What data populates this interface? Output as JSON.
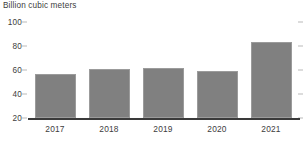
{
  "chart_data": {
    "type": "bar",
    "title": "Billion cubic meters",
    "xlabel": "",
    "ylabel": "",
    "categories": [
      "2017",
      "2018",
      "2019",
      "2020",
      "2021"
    ],
    "values": [
      57,
      61,
      62,
      59,
      83
    ],
    "series": [
      {
        "name": "Billion cubic meters",
        "values": [
          57,
          61,
          62,
          59,
          83
        ]
      }
    ],
    "ylim": [
      20,
      100
    ],
    "yticks": [
      20,
      40,
      60,
      80,
      100
    ],
    "ytick_labels": [
      "20",
      "40",
      "60",
      "80",
      "100"
    ],
    "grid": false,
    "legend": false,
    "legend_position": "none",
    "bar_color": "#808080",
    "bar_border_color": "#9b9b9b",
    "axis_color": "#3a3a3a",
    "tick_color": "#b9b9b9",
    "text_color": "#3d3d3d",
    "background": "#ffffff"
  }
}
